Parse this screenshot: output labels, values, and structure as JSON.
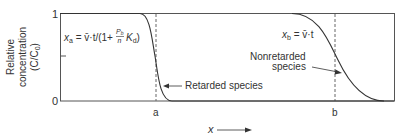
{
  "diagram": {
    "y_axis": {
      "label_line1": "Relative",
      "label_line2": "concentration",
      "label_line3": "(C/C",
      "label_line3_sub": "0",
      "label_line3_end": ")",
      "tick_top": "1",
      "tick_bottom": "0"
    },
    "x_axis": {
      "label": "x",
      "marker_a": "a",
      "marker_b": "b"
    },
    "equation_a": {
      "x": "x",
      "sub": "a",
      "rhs": " = v̄·t/(1+",
      "frac_num": "P",
      "frac_num_sub": "b",
      "frac_den": "n",
      "kd": "K",
      "kd_sub": "d",
      "close": ")"
    },
    "equation_b": {
      "x": "x",
      "sub": "b",
      "rhs": " = v̄·t"
    },
    "labels": {
      "retarded": "Retarded species",
      "nonretarded_line1": "Nonretarded",
      "nonretarded_line2": "species"
    },
    "colors": {
      "curve": "#333333",
      "frame": "#555555",
      "dashed": "#666666"
    }
  }
}
